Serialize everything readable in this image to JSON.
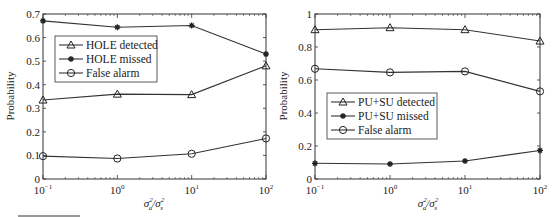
{
  "chart_data": [
    {
      "type": "line",
      "title": "",
      "xlabel": "σ_a^2/σ_s^2",
      "ylabel": "Probability",
      "xscale": "log",
      "x": [
        0.1,
        1,
        10,
        100
      ],
      "x_tick_labels": [
        "10^-1",
        "10^0",
        "10^1",
        "10^2"
      ],
      "ylim": [
        0,
        0.7
      ],
      "y_ticks": [
        0,
        0.1,
        0.2,
        0.3,
        0.4,
        0.5,
        0.6,
        0.7
      ],
      "y_tick_labels": [
        "0",
        "0.1",
        "0.2",
        "0.3",
        "0.4",
        "0.5",
        "0.6",
        "0.7"
      ],
      "grid": false,
      "legend_position": "upper left",
      "series": [
        {
          "name": "HOLE detected",
          "marker": "triangle",
          "values": [
            0.335,
            0.36,
            0.358,
            0.48
          ]
        },
        {
          "name": "HOLE missed",
          "marker": "star",
          "values": [
            0.671,
            0.644,
            0.651,
            0.53
          ]
        },
        {
          "name": "False alarm",
          "marker": "circle",
          "values": [
            0.097,
            0.087,
            0.107,
            0.172
          ]
        }
      ]
    },
    {
      "type": "line",
      "title": "",
      "xlabel": "σ_a^2/σ_s^2",
      "ylabel": "Probability",
      "xscale": "log",
      "x": [
        0.1,
        1,
        10,
        100
      ],
      "x_tick_labels": [
        "10^-1",
        "10^0",
        "10^1",
        "10^2"
      ],
      "ylim": [
        0,
        1
      ],
      "y_ticks": [
        0,
        0.2,
        0.4,
        0.6,
        0.8,
        1
      ],
      "y_tick_labels": [
        "0",
        "0.2",
        "0.4",
        "0.6",
        "0.8",
        "1"
      ],
      "grid": false,
      "legend_position": "center left",
      "series": [
        {
          "name": "PU+SU detected",
          "marker": "triangle",
          "values": [
            0.905,
            0.917,
            0.905,
            0.836
          ]
        },
        {
          "name": "PU+SU missed",
          "marker": "star",
          "values": [
            0.095,
            0.091,
            0.109,
            0.173
          ]
        },
        {
          "name": "False alarm",
          "marker": "circle",
          "values": [
            0.668,
            0.646,
            0.652,
            0.531
          ]
        }
      ]
    }
  ],
  "left": {
    "ylabel": "Probability",
    "xlabel_base": "σ",
    "xlabel_sub1": "a",
    "xlabel_sub2": "s",
    "xlabel_sup": "2",
    "legend": [
      "HOLE detected",
      "HOLE missed",
      "False alarm"
    ]
  },
  "right": {
    "ylabel": "Probability",
    "xlabel_base": "σ",
    "xlabel_sub1": "a",
    "xlabel_sub2": "s",
    "xlabel_sup": "2",
    "legend": [
      "PU+SU detected",
      "PU+SU missed",
      "False alarm"
    ]
  },
  "x_ticks": {
    "base": "10",
    "exps": [
      "−1",
      "0",
      "1",
      "2"
    ]
  },
  "left_y_ticks": [
    "0",
    "0.1",
    "0.2",
    "0.3",
    "0.4",
    "0.5",
    "0.6",
    "0.7"
  ],
  "right_y_ticks": [
    "0",
    "0.2",
    "0.4",
    "0.6",
    "0.8",
    "1"
  ]
}
